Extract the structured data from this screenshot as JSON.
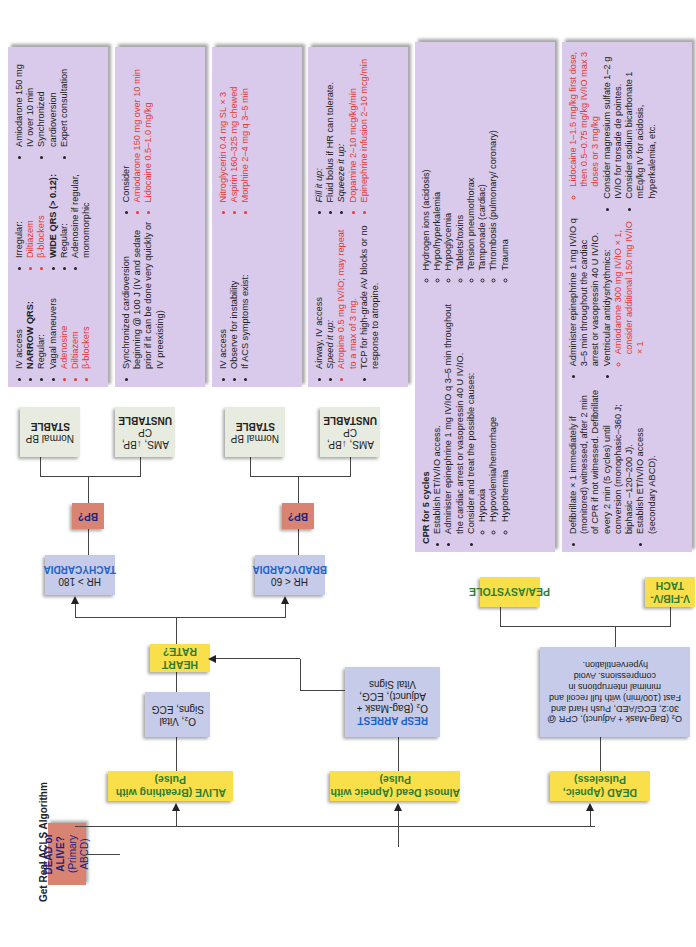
{
  "title": "Get Real ACLS Algorithm",
  "root": {
    "line1": "DEAD or ALIVE?",
    "line2": "(Primary ABCD)"
  },
  "branches": {
    "dead": "DEAD (Apneic, Pulseless)",
    "almost_dead": "Almost Dead (Apneic with Pulse)",
    "alive": "ALIVE (Breathing with Pulse)"
  },
  "dead_action": "O₂ (Bag-Mask + Adjunct), CPR @ 30:2, ECG/AED, Push Hard and Fast (100/min) with full recoil and minimal interruptions in compressions. Avoid hyperventilation.",
  "resp_arrest": {
    "title": "RESP ARREST",
    "body": "O₂ (Bag-Mask + Adjunct), ECG, Vital Signs"
  },
  "alive_action": "O₂, Vital Signs, ECG",
  "heart_rate": "HEART RATE?",
  "brady": {
    "line1": "HR < 60",
    "line2": "BRADYCARDIA"
  },
  "tachy": {
    "line1": "HR > 180",
    "line2": "TACHYCARDIA"
  },
  "bp_label": "BP?",
  "unstable": {
    "line1": "AMS, ↓BP, CP",
    "line2": "UNSTABLE"
  },
  "stable": {
    "line1": "Normal BP",
    "line2": "STABLE"
  },
  "vfib": {
    "label": "V-FIB/V-TACH",
    "items": [
      "Defibrillate × 1 immediately if (monitored) witnessed, after 2 min of CPR if not witnessed. Defibrillate every 2 min (5 cycles) until conversion (monophasic–360 J; biphasic –120–200 J).",
      "Establish ET/IV/IO access (secondary ABCD).",
      "Administer epinephrine 1 mg IV/IO q 3–5 min throughout the cardiac arrest or vasopressin 40 U IV/IO.",
      "Ventricular antidysrhythmics:",
      "Amiodarone 300 mg IV/IO × 1, consider additional 150 mg IV/IO × 1",
      "Lidocaine 1–1.5 mg/kg first dose, then 0.5–0.75 mg/kg IV/IO max 3 doses or 3 mg/kg",
      "Consider magnesium sulfate 1–2 g IV/IO for torsade de pointes.",
      "Consider sodium bicarbonate 1 mEq/kg IV for acidosis, hyperkalemia, etc."
    ]
  },
  "pea": {
    "label": "PEA/ASYSTOLE",
    "heading": "CPR for 5 cycles",
    "items": [
      "Establish ET/IV/IO access.",
      "Administer epinephrine 1 mg IV/IO q 3–5 min throughout the cardiac arrest or vasopressin 40 U IV/IO.",
      "Consider and treat the possible causes:"
    ],
    "causes": [
      "Hypoxia",
      "Hypovolemia/hemorrhage",
      "Hypothermia",
      "Hydrogen ions (acidosis)",
      "Hypo/hyperkalemia",
      "Hypoglycemia",
      "Tablets/toxins",
      "Tension pneumothorax",
      "Tamponade (cardiac)",
      "Thrombosis (pulmonary/ coronary)",
      "Trauma"
    ]
  },
  "brady_unstable": [
    "Airway, IV access",
    "Speed it up:",
    "Atropine 0.5 mg IV/IO; may repeat to a max of 3 mg.",
    "TCP for high-grade AV blocks or no response to atropine.",
    "Fill it up:",
    "Fluid bolus if HR can tolerate.",
    "Squeeze it up:",
    "Dopamine 2–10 mcg/kg/min",
    "Epinephrine infusion 2–10 mcg/min"
  ],
  "brady_stable": [
    "IV access",
    "Observe for instability",
    "If ACS symptoms exist:",
    "Nitroglycerin 0.4 mg SL × 3",
    "Aspirin 160–325 mg chewed",
    "Morphine 2–4 mg q 3–5 min"
  ],
  "tachy_unstable": [
    "Synchronized cardioversion beginning @ 100 J (IV and sedate prior if it can be done very quickly or IV preexisting)",
    "Consider",
    "Amiodarone 150 mg over 10 min",
    "Lidocaine 0.5–1.0 mg/kg"
  ],
  "tachy_stable": {
    "items": [
      "IV access",
      "NARROW QRS:",
      "Regular:",
      "Vagal maneuvers",
      "Adenosine",
      "Diltiazem",
      "β-blockers",
      "Irregular:",
      "Diltiazem",
      "β-blockers",
      "WIDE QRS (> 0.12):",
      "Regular:",
      "Adenosine if regular, monomorphic",
      "Amiodarone 150 mg IV over 10 min",
      "Synchronized cardioversion",
      "Expert consultation"
    ]
  },
  "colors": {
    "yellow": "#f9e04b",
    "salmon": "#d98472",
    "blue": "#c5cbe9",
    "purple": "#d9c9ea",
    "grey": "#e8ebe0",
    "drug_red": "#e53935"
  }
}
